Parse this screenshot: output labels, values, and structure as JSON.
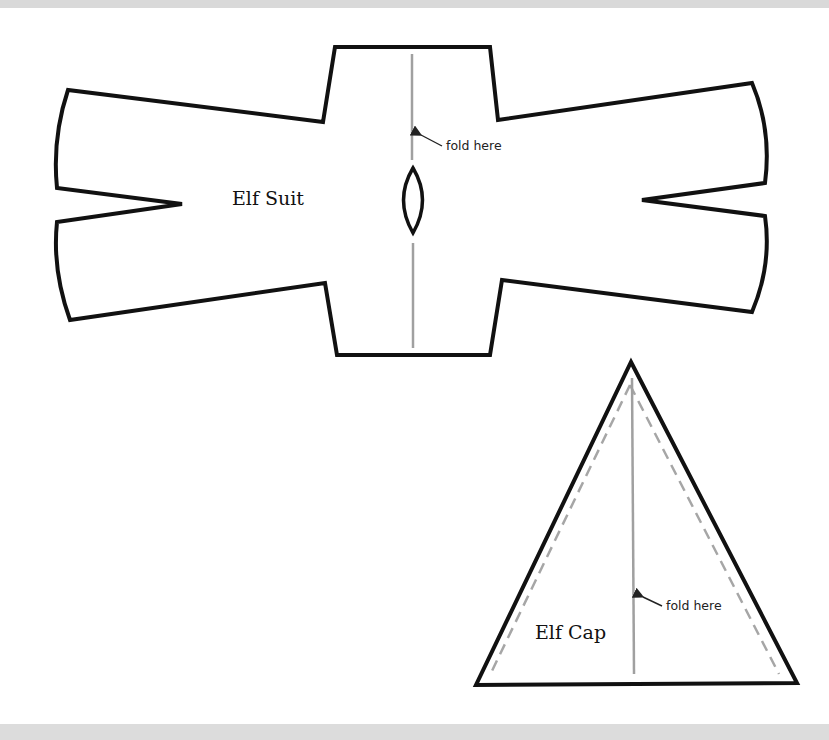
{
  "page": {
    "background": "#ffffff",
    "top_band_color": "#d9d9d9",
    "bottom_band_color": "#dcdcdc"
  },
  "suit_pattern": {
    "label": "Elf Suit",
    "fold_label": "fold here",
    "outline_color": "#111111",
    "fold_line_color": "#a0a0a0"
  },
  "cap_pattern": {
    "label": "Elf Cap",
    "fold_label": "fold here",
    "outline_color": "#111111",
    "seam_line_color": "#a6a6a6",
    "fold_line_color": "#a0a0a0"
  }
}
